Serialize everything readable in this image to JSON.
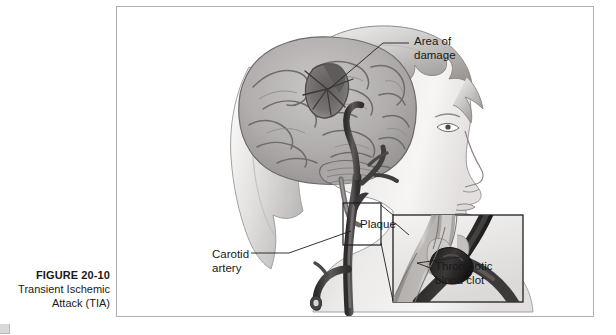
{
  "caption": {
    "figure_number": "FIGURE 20-10",
    "title_line_1": "Transient Ischemic",
    "title_line_2": "Attack (TIA)"
  },
  "figure": {
    "labels": {
      "area_of_damage_line_1": "Area of",
      "area_of_damage_line_2": "damage",
      "carotid_artery_line_1": "Carotid",
      "carotid_artery_line_2": "artery",
      "plaque": "Plaque",
      "thrombotic_clot_line_1": "Thrombotic",
      "thrombotic_clot_line_2": "blood clot"
    },
    "illustration": {
      "subject": "lateral-head-profile-with-brain-and-carotid-artery",
      "view": "right-facing-profile",
      "inset": {
        "title": "magnified-carotid-bifurcation",
        "contents": "atherosclerotic-plaque-and-occluding-thrombus"
      }
    }
  },
  "colors": {
    "frame_border": "#b0b0b0",
    "page_background": "#ffffff",
    "text": "#1a1a1a",
    "skin_light": "#f2f0ef",
    "skin_shadow": "#c9c6c4",
    "hair_light": "#dedbd9",
    "hair_shadow": "#a8a5a3",
    "brain_base": "#b5b2b1",
    "brain_shadow": "#8d8a89",
    "brain_damage": "#6e6b6a",
    "vessel_dark": "#3a3737",
    "vessel_mid": "#6a6766",
    "leader_line": "#2b2b2b"
  }
}
